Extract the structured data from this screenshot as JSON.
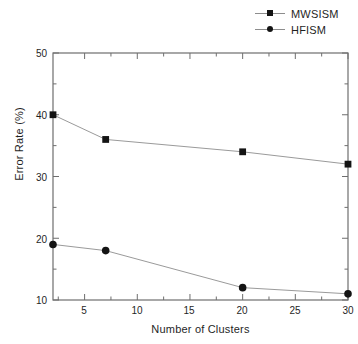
{
  "figure": {
    "ghost_caption": "",
    "background_color": "#ffffff",
    "axis_color": "#6e6e6e",
    "line_color": "#9a9a9a",
    "marker_color": "#141414",
    "text_color": "#1f1f1f"
  },
  "legend": {
    "position": "top-right",
    "entries": [
      {
        "label": "MWSISM",
        "marker": "square-marker-icon"
      },
      {
        "label": "HFISM",
        "marker": "circle-marker-icon"
      }
    ]
  },
  "axes": {
    "x": {
      "label": "Number of Clusters",
      "ticks": [
        "5",
        "10",
        "15",
        "20",
        "25",
        "30"
      ],
      "tick_values": [
        5,
        10,
        15,
        20,
        25,
        30
      ],
      "min": 2,
      "max": 30
    },
    "y": {
      "label": "Error Rate (%)",
      "ticks": [
        "10",
        "20",
        "30",
        "40",
        "50"
      ],
      "tick_values": [
        10,
        20,
        30,
        40,
        50
      ],
      "min": 10,
      "max": 50
    }
  },
  "chart_data": {
    "type": "line",
    "title": "",
    "xlabel": "Number of Clusters",
    "ylabel": "Error Rate (%)",
    "x": [
      2,
      7,
      20,
      30
    ],
    "xlim": [
      2,
      30
    ],
    "ylim": [
      10,
      50
    ],
    "grid": false,
    "legend_position": "top-right",
    "series": [
      {
        "name": "MWSISM",
        "marker": "square",
        "values": [
          40,
          36,
          34,
          32
        ]
      },
      {
        "name": "HFISM",
        "marker": "circle",
        "values": [
          19,
          18,
          12,
          11
        ]
      }
    ]
  }
}
